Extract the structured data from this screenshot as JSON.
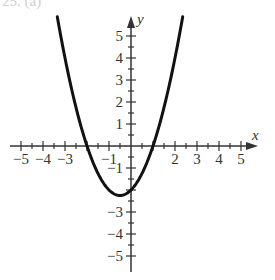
{
  "header": {
    "label": "25. (a)"
  },
  "chart_data": {
    "type": "line",
    "title": "",
    "xlabel": "x",
    "ylabel": "y",
    "function": "y = x^2 + x - 2",
    "xlim": [
      -5.5,
      5.6
    ],
    "ylim": [
      -5.6,
      5.9
    ],
    "grid": false,
    "x_tick_labels": [
      "-5",
      "-4",
      "-3",
      "-1",
      "2",
      "3",
      "4",
      "5"
    ],
    "x_tick_values": [
      -5,
      -4,
      -3,
      -1,
      2,
      3,
      4,
      5
    ],
    "y_tick_labels": [
      "5",
      "4",
      "3",
      "2",
      "1",
      "-1",
      "-3",
      "-4",
      "-5"
    ],
    "y_tick_values": [
      5,
      4,
      3,
      2,
      1,
      -1,
      -3,
      -4,
      -5
    ],
    "minor_tick_step": 0.5,
    "series": [
      {
        "name": "parabola",
        "x_range": [
          -3.35,
          2.35
        ],
        "key_points": {
          "vertex": [
            -0.5,
            -2.25
          ],
          "x_intercepts": [
            -2,
            1
          ],
          "y_intercept": [
            0,
            -2
          ]
        },
        "color": "#111111"
      }
    ]
  },
  "colors": {
    "axis": "#333333",
    "curve": "#111111",
    "background": "#ffffff"
  }
}
